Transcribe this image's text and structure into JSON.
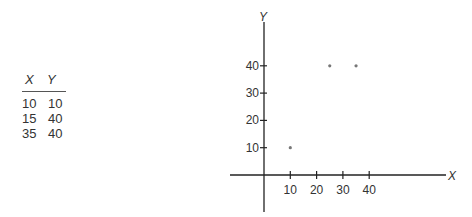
{
  "table": {
    "headers": [
      "X",
      "Y"
    ],
    "rows": [
      [
        "10",
        "10"
      ],
      [
        "15",
        "40"
      ],
      [
        "35",
        "40"
      ]
    ]
  },
  "chart_data": {
    "type": "scatter",
    "title": "",
    "xlabel": "X",
    "ylabel": "Y",
    "x_ticks": [
      10,
      20,
      30,
      40
    ],
    "y_ticks": [
      10,
      20,
      30,
      40
    ],
    "points": [
      {
        "x": 10,
        "y": 10
      },
      {
        "x": 25,
        "y": 40
      },
      {
        "x": 35,
        "y": 40
      }
    ],
    "table_values": [
      {
        "x": 10,
        "y": 10
      },
      {
        "x": 15,
        "y": 40
      },
      {
        "x": 35,
        "y": 40
      }
    ],
    "grid": false
  }
}
